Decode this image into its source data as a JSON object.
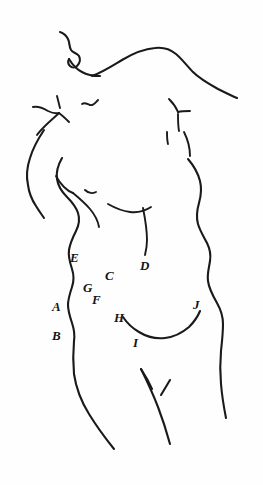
{
  "figure": {
    "background_color": "#fefefe",
    "ink_color": "#1a1a1a",
    "width": 263,
    "height": 485
  },
  "labels": [
    {
      "id": "A",
      "text": "A",
      "x": 52,
      "y": 300
    },
    {
      "id": "B",
      "text": "B",
      "x": 52,
      "y": 329
    },
    {
      "id": "C",
      "text": "C",
      "x": 105,
      "y": 269
    },
    {
      "id": "D",
      "text": "D",
      "x": 140,
      "y": 259
    },
    {
      "id": "E",
      "text": "E",
      "x": 70,
      "y": 251
    },
    {
      "id": "F",
      "text": "F",
      "x": 92,
      "y": 293
    },
    {
      "id": "G",
      "text": "G",
      "x": 83,
      "y": 281
    },
    {
      "id": "H",
      "text": "H",
      "x": 114,
      "y": 311
    },
    {
      "id": "I",
      "text": "I",
      "x": 133,
      "y": 336
    },
    {
      "id": "J",
      "text": "J",
      "x": 193,
      "y": 298
    }
  ]
}
